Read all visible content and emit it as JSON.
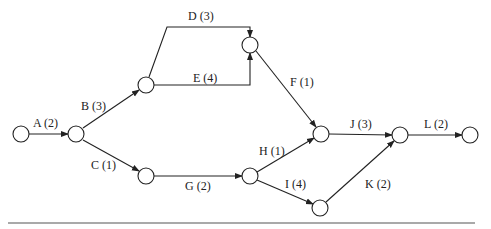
{
  "diagram": {
    "type": "activity-on-arrow network",
    "nodes": [
      {
        "id": "n1",
        "x": 21,
        "y": 134
      },
      {
        "id": "n2",
        "x": 76,
        "y": 134
      },
      {
        "id": "n3",
        "x": 146,
        "y": 85
      },
      {
        "id": "n4",
        "x": 250,
        "y": 45
      },
      {
        "id": "n5",
        "x": 146,
        "y": 176
      },
      {
        "id": "n6",
        "x": 250,
        "y": 176
      },
      {
        "id": "n7",
        "x": 321,
        "y": 134
      },
      {
        "id": "n8",
        "x": 320,
        "y": 208
      },
      {
        "id": "n9",
        "x": 400,
        "y": 135
      },
      {
        "id": "n10",
        "x": 470,
        "y": 135
      }
    ],
    "activities": [
      {
        "name": "A",
        "duration": 2,
        "label": "A (2)",
        "from": "n1",
        "to": "n2"
      },
      {
        "name": "B",
        "duration": 3,
        "label": "B (3)",
        "from": "n2",
        "to": "n3"
      },
      {
        "name": "C",
        "duration": 1,
        "label": "C (1)",
        "from": "n2",
        "to": "n5"
      },
      {
        "name": "D",
        "duration": 3,
        "label": "D (3)",
        "from": "n3",
        "to": "n4"
      },
      {
        "name": "E",
        "duration": 4,
        "label": "E (4)",
        "from": "n3",
        "to": "n4"
      },
      {
        "name": "F",
        "duration": 1,
        "label": "F (1)",
        "from": "n4",
        "to": "n7"
      },
      {
        "name": "G",
        "duration": 2,
        "label": "G (2)",
        "from": "n5",
        "to": "n6"
      },
      {
        "name": "H",
        "duration": 1,
        "label": "H (1)",
        "from": "n6",
        "to": "n7"
      },
      {
        "name": "I",
        "duration": 4,
        "label": "I (4)",
        "from": "n6",
        "to": "n8"
      },
      {
        "name": "J",
        "duration": 3,
        "label": "J (3)",
        "from": "n7",
        "to": "n9"
      },
      {
        "name": "K",
        "duration": 2,
        "label": "K (2)",
        "from": "n8",
        "to": "n9"
      },
      {
        "name": "L",
        "duration": 2,
        "label": "L (2)",
        "from": "n9",
        "to": "n10"
      }
    ]
  },
  "labels": {
    "A": "A (2)",
    "B": "B (3)",
    "C": "C (1)",
    "D": "D (3)",
    "E": "E (4)",
    "F": "F (1)",
    "G": "G (2)",
    "H": "H (1)",
    "I": "I (4)",
    "J": "J (3)",
    "K": "K (2)",
    "L": "L (2)"
  },
  "colors": {
    "stroke": "#222222",
    "background": "#ffffff",
    "divider": "#555555"
  }
}
